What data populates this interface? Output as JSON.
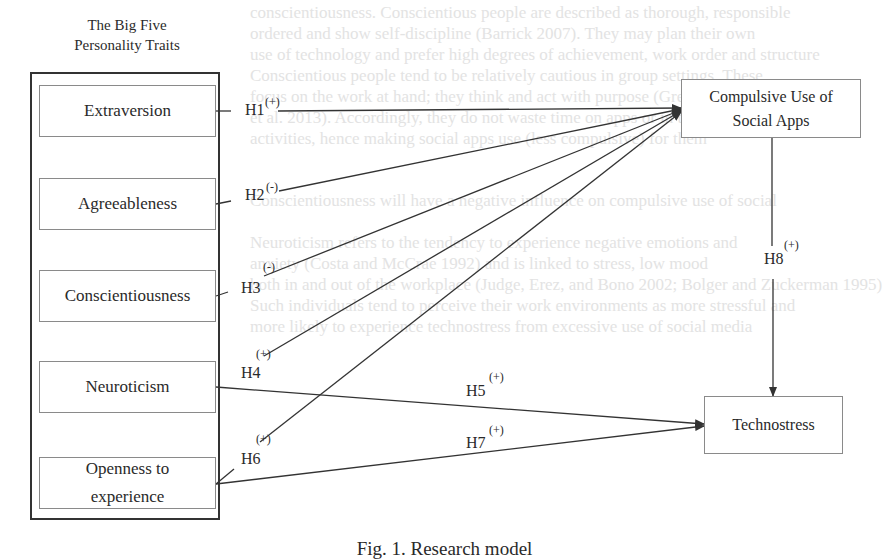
{
  "diagram": {
    "group_title_line1": "The Big Five",
    "group_title_line2": "Personality Traits",
    "traits": [
      {
        "label": "Extraversion"
      },
      {
        "label": "Agreeableness"
      },
      {
        "label": "Conscientiousness"
      },
      {
        "label": "Neuroticism"
      },
      {
        "label": "Openness to experience"
      }
    ],
    "targets": {
      "compulsive": "Compulsive Use of Social Apps",
      "technostress": "Technostress"
    },
    "hypotheses": [
      {
        "id": "H1",
        "sign": "(+)",
        "from": "Extraversion",
        "to": "Compulsive Use of Social Apps"
      },
      {
        "id": "H2",
        "sign": "(-)",
        "from": "Agreeableness",
        "to": "Compulsive Use of Social Apps"
      },
      {
        "id": "H3",
        "sign": "(-)",
        "from": "Conscientiousness",
        "to": "Compulsive Use of Social Apps"
      },
      {
        "id": "H4",
        "sign": "(+)",
        "from": "Neuroticism",
        "to": "Compulsive Use of Social Apps"
      },
      {
        "id": "H5",
        "sign": "(+)",
        "from": "Neuroticism",
        "to": "Technostress"
      },
      {
        "id": "H6",
        "sign": "(+)",
        "from": "Openness to experience",
        "to": "Compulsive Use of Social Apps"
      },
      {
        "id": "H7",
        "sign": "(+)",
        "from": "Openness to experience",
        "to": "Technostress"
      },
      {
        "id": "H8",
        "sign": "(+)",
        "from": "Compulsive Use of Social Apps",
        "to": "Technostress"
      }
    ],
    "caption": "Fig. 1. Research model",
    "colors": {
      "line": "#333333",
      "box_border": "#8a8a8a",
      "background": "#ffffff",
      "bleed_text": "#e3e3e3"
    }
  }
}
